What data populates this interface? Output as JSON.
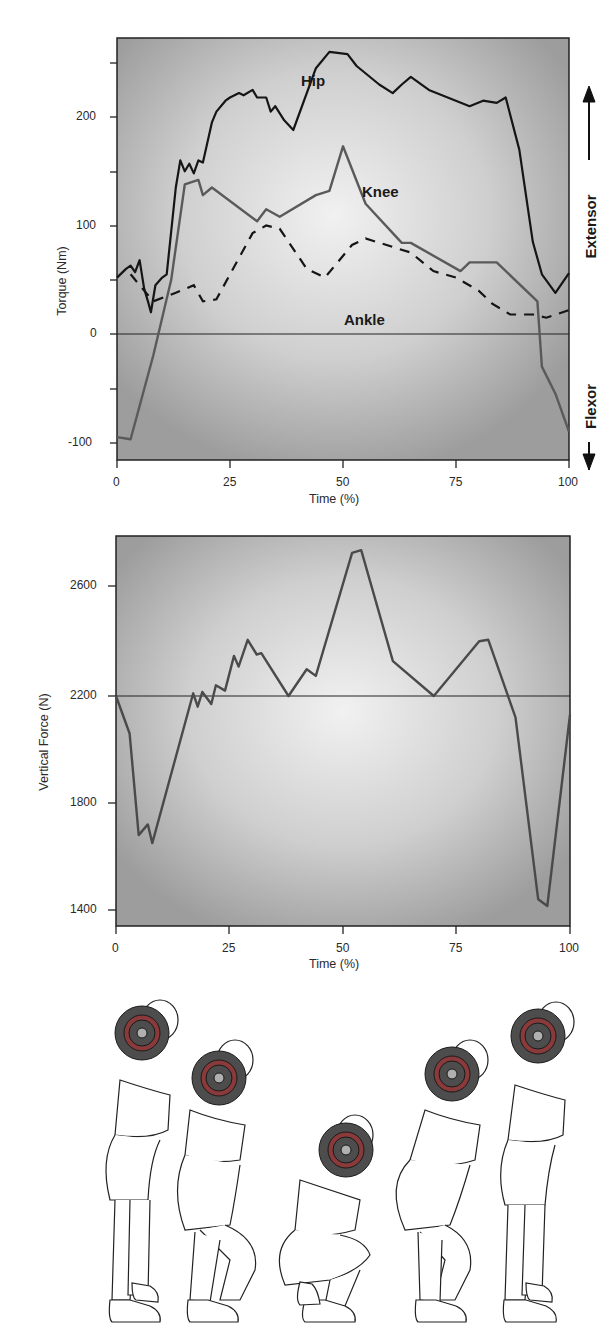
{
  "chart_data": [
    {
      "type": "line",
      "title": "",
      "xlabel": "Time (%)",
      "ylabel": "Torque (Nm)",
      "xlim": [
        0,
        100
      ],
      "ylim": [
        -115,
        280
      ],
      "x_ticks": [
        "0",
        "25",
        "50",
        "75",
        "100"
      ],
      "y_ticks": [
        "-100",
        "0",
        "100",
        "200"
      ],
      "y_minor_ticks": [
        -50,
        50,
        150,
        250
      ],
      "reference_line": 0,
      "side_labels": {
        "up": "Extensor",
        "down": "Flexor"
      },
      "series": [
        {
          "name": "Hip",
          "style": "solid",
          "color": "#151515",
          "points": [
            [
              0,
              52
            ],
            [
              2,
              60
            ],
            [
              3,
              63
            ],
            [
              4,
              57
            ],
            [
              5,
              68
            ],
            [
              6,
              42
            ],
            [
              7,
              28
            ],
            [
              7.5,
              20
            ],
            [
              8.5,
              45
            ],
            [
              10,
              52
            ],
            [
              11,
              55
            ],
            [
              13,
              135
            ],
            [
              14,
              160
            ],
            [
              15,
              150
            ],
            [
              16,
              157
            ],
            [
              17,
              148
            ],
            [
              18,
              160
            ],
            [
              19,
              158
            ],
            [
              21,
              195
            ],
            [
              22,
              205
            ],
            [
              24,
              215
            ],
            [
              25,
              218
            ],
            [
              27,
              222
            ],
            [
              28,
              220
            ],
            [
              30,
              225
            ],
            [
              31,
              218
            ],
            [
              33,
              218
            ],
            [
              34,
              205
            ],
            [
              35,
              210
            ],
            [
              37,
              197
            ],
            [
              39,
              188
            ],
            [
              44,
              245
            ],
            [
              47,
              260
            ],
            [
              51,
              258
            ],
            [
              53,
              247
            ],
            [
              58,
              230
            ],
            [
              61,
              222
            ],
            [
              63,
              230
            ],
            [
              65,
              237
            ],
            [
              69,
              225
            ],
            [
              78,
              210
            ],
            [
              81,
              215
            ],
            [
              84,
              213
            ],
            [
              86,
              218
            ],
            [
              89,
              170
            ],
            [
              92,
              85
            ],
            [
              94,
              55
            ],
            [
              97,
              38
            ],
            [
              100,
              56
            ]
          ]
        },
        {
          "name": "Knee",
          "style": "solid",
          "color": "#5a5a5a",
          "points": [
            [
              0,
              -95
            ],
            [
              3,
              -97
            ],
            [
              8,
              -20
            ],
            [
              12,
              50
            ],
            [
              15,
              138
            ],
            [
              18,
              142
            ],
            [
              19,
              128
            ],
            [
              21,
              135
            ],
            [
              31,
              104
            ],
            [
              33,
              115
            ],
            [
              36,
              108
            ],
            [
              44,
              128
            ],
            [
              47,
              132
            ],
            [
              50,
              173
            ],
            [
              55,
              120
            ],
            [
              63,
              84
            ],
            [
              65,
              84
            ],
            [
              76,
              58
            ],
            [
              78,
              66
            ],
            [
              84,
              66
            ],
            [
              93,
              30
            ],
            [
              94,
              -30
            ],
            [
              97,
              -55
            ],
            [
              100,
              -90
            ]
          ]
        },
        {
          "name": "Ankle",
          "style": "dashed",
          "color": "#151515",
          "points": [
            [
              3,
              55
            ],
            [
              5,
              45
            ],
            [
              8,
              30
            ],
            [
              13,
              38
            ],
            [
              17,
              45
            ],
            [
              19,
              30
            ],
            [
              22,
              32
            ],
            [
              30,
              93
            ],
            [
              33,
              100
            ],
            [
              36,
              97
            ],
            [
              42,
              60
            ],
            [
              46,
              52
            ],
            [
              52,
              82
            ],
            [
              55,
              88
            ],
            [
              65,
              75
            ],
            [
              70,
              58
            ],
            [
              75,
              52
            ],
            [
              80,
              40
            ],
            [
              83,
              28
            ],
            [
              87,
              18
            ],
            [
              92,
              18
            ],
            [
              95,
              15
            ],
            [
              100,
              22
            ]
          ]
        }
      ]
    },
    {
      "type": "line",
      "title": "",
      "xlabel": "Time (%)",
      "ylabel": "Vertical Force (N)",
      "xlim": [
        0,
        100
      ],
      "ylim": [
        1310,
        2770
      ],
      "x_ticks": [
        "0",
        "25",
        "50",
        "75",
        "100"
      ],
      "y_ticks": [
        "1400",
        "1800",
        "2200",
        "2600"
      ],
      "reference_line": 2200,
      "series": [
        {
          "name": "Vertical Force",
          "style": "solid",
          "color": "#4a4a4a",
          "points": [
            [
              0,
              2200
            ],
            [
              3,
              2060
            ],
            [
              5,
              1680
            ],
            [
              7,
              1720
            ],
            [
              8,
              1650
            ],
            [
              17,
              2210
            ],
            [
              18,
              2160
            ],
            [
              19,
              2215
            ],
            [
              21,
              2170
            ],
            [
              22,
              2240
            ],
            [
              24,
              2220
            ],
            [
              26,
              2350
            ],
            [
              27,
              2310
            ],
            [
              29,
              2410
            ],
            [
              31,
              2355
            ],
            [
              32,
              2360
            ],
            [
              38,
              2200
            ],
            [
              42,
              2300
            ],
            [
              44,
              2275
            ],
            [
              52,
              2735
            ],
            [
              54,
              2745
            ],
            [
              61,
              2330
            ],
            [
              70,
              2200
            ],
            [
              80,
              2405
            ],
            [
              82,
              2410
            ],
            [
              88,
              2120
            ],
            [
              93,
              1440
            ],
            [
              95,
              1415
            ],
            [
              100,
              2130
            ]
          ]
        }
      ]
    }
  ],
  "torque_chart": {
    "ylabel": "Torque (Nm)",
    "xlabel": "Time (%)",
    "y_tick_labels": {
      "t200": "200",
      "t100": "100",
      "t0": "0",
      "tm100": "-100"
    },
    "x_tick_labels": {
      "x0": "0",
      "x25": "25",
      "x50": "50",
      "x75": "75",
      "x100": "100"
    },
    "series_labels": {
      "hip": "Hip",
      "knee": "Knee",
      "ankle": "Ankle"
    },
    "side_labels": {
      "extensor": "Extensor",
      "flexor": "Flexor"
    }
  },
  "force_chart": {
    "ylabel": "Vertical Force (N)",
    "xlabel": "Time (%)",
    "y_tick_labels": {
      "t2600": "2600",
      "t2200": "2200",
      "t1800": "1800",
      "t1400": "1400"
    },
    "x_tick_labels": {
      "x0": "0",
      "x25": "25",
      "x50": "50",
      "x75": "75",
      "x100": "100"
    }
  },
  "illustration": {
    "description": "Five figures of a squat sequence with barbell plate",
    "plate_color": "#4d4d4d",
    "plate_ring_color": "#8a3a3a",
    "plate_center_color": "#b0b0b0"
  }
}
